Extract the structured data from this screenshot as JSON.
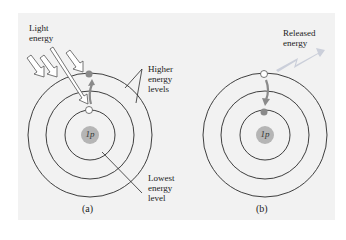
{
  "figure": {
    "panel_a": {
      "caption": "(a)",
      "nucleus_label": "1p",
      "light_label_line1": "Light",
      "light_label_line2": "energy",
      "higher_label_line1": "Higher",
      "higher_label_line2": "energy",
      "higher_label_line3": "levels",
      "lowest_label_line1": "Lowest",
      "lowest_label_line2": "energy",
      "lowest_label_line3": "level",
      "electron_transition": "inner orbit to outer orbit (absorption)"
    },
    "panel_b": {
      "caption": "(b)",
      "nucleus_label": "1p",
      "released_label_line1": "Released",
      "released_label_line2": "energy",
      "electron_transition": "outer orbit to inner orbit (emission)"
    },
    "colors": {
      "background": "#f2f2f2",
      "orbit_stroke": "#2a2a2a",
      "nucleus_fill": "#b5b5b5",
      "electron_fill": "#8a8a8a",
      "arrow_fill": "#9a9a9a"
    }
  }
}
